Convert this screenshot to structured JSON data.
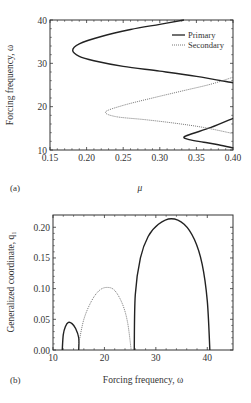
{
  "chart_data": [
    {
      "panel": "(a)",
      "type": "line",
      "xlabel": "μ",
      "ylabel": "Forcing frequency, ω",
      "xlim": [
        0.15,
        0.4
      ],
      "ylim": [
        10,
        40
      ],
      "xticks": [
        "0.15",
        "0.20",
        "0.25",
        "0.30",
        "0.35",
        "0.40"
      ],
      "yticks": [
        "10",
        "20",
        "30",
        "40"
      ],
      "legend": {
        "position": "upper right",
        "entries": [
          "Primary",
          "Secondary"
        ]
      },
      "series": [
        {
          "name": "Primary",
          "style": "solid",
          "points": [
            [
              0.333,
              40
            ],
            [
              0.3,
              39.0
            ],
            [
              0.26,
              37.8
            ],
            [
              0.22,
              36.2
            ],
            [
              0.19,
              34.5
            ],
            [
              0.181,
              33
            ],
            [
              0.19,
              31.6
            ],
            [
              0.21,
              30.6
            ],
            [
              0.25,
              29.3
            ],
            [
              0.3,
              28.2
            ],
            [
              0.35,
              27.0
            ],
            [
              0.4,
              25.5
            ]
          ]
        },
        {
          "name": "Primary (low)",
          "style": "solid",
          "points": [
            [
              0.4,
              17.3
            ],
            [
              0.37,
              15.2
            ],
            [
              0.345,
              13.8
            ],
            [
              0.333,
              13.0
            ],
            [
              0.34,
              12.4
            ],
            [
              0.36,
              11.8
            ],
            [
              0.38,
              11.2
            ],
            [
              0.4,
              10.5
            ]
          ]
        },
        {
          "name": "Secondary",
          "style": "dotted",
          "points": [
            [
              0.4,
              26.8
            ],
            [
              0.37,
              25.2
            ],
            [
              0.33,
              23.6
            ],
            [
              0.29,
              22.0
            ],
            [
              0.25,
              20.3
            ],
            [
              0.226,
              18.8
            ],
            [
              0.24,
              17.7
            ],
            [
              0.28,
              17.0
            ],
            [
              0.32,
              16.2
            ],
            [
              0.36,
              15.2
            ],
            [
              0.4,
              13.8
            ]
          ]
        }
      ]
    },
    {
      "panel": "(b)",
      "type": "line",
      "xlabel": "Forcing frequency, ω",
      "ylabel": "Generalized coordinate, q1",
      "xlim": [
        10,
        45
      ],
      "ylim": [
        0,
        0.22
      ],
      "xticks": [
        "10",
        "20",
        "30",
        "40"
      ],
      "yticks": [
        "0.00",
        "0.05",
        "0.10",
        "0.15",
        "0.20"
      ],
      "series": [
        {
          "name": "Primary lobe 1",
          "style": "solid",
          "points": [
            [
              11.8,
              0
            ],
            [
              12.0,
              0.025
            ],
            [
              12.4,
              0.038
            ],
            [
              13.0,
              0.045
            ],
            [
              13.7,
              0.043
            ],
            [
              14.4,
              0.035
            ],
            [
              15.0,
              0.02
            ],
            [
              15.0,
              0
            ]
          ]
        },
        {
          "name": "Secondary lobe",
          "style": "dotted",
          "points": [
            [
              15.0,
              0.01
            ],
            [
              16.0,
              0.05
            ],
            [
              17.5,
              0.08
            ],
            [
              19.0,
              0.097
            ],
            [
              20.5,
              0.102
            ],
            [
              22.0,
              0.097
            ],
            [
              23.5,
              0.075
            ],
            [
              24.5,
              0.045
            ],
            [
              25.2,
              0.0
            ]
          ]
        },
        {
          "name": "Primary lobe 2",
          "style": "solid",
          "points": [
            [
              25.8,
              0
            ],
            [
              26.0,
              0.09
            ],
            [
              27.0,
              0.15
            ],
            [
              28.5,
              0.185
            ],
            [
              30.5,
              0.205
            ],
            [
              33.0,
              0.214
            ],
            [
              35.5,
              0.205
            ],
            [
              37.5,
              0.18
            ],
            [
              39.0,
              0.14
            ],
            [
              40.0,
              0.08
            ],
            [
              40.5,
              0
            ]
          ]
        }
      ]
    }
  ],
  "panels": {
    "a": {
      "label": "(a)",
      "xlabel": "μ",
      "ylabel": "Forcing frequency,  ω",
      "legend_primary": "Primary",
      "legend_secondary": "Secondary",
      "xticks": [
        "0.15",
        "0.20",
        "0.25",
        "0.30",
        "0.35",
        "0.40"
      ],
      "yticks": [
        "10",
        "20",
        "30",
        "40"
      ]
    },
    "b": {
      "label": "(b)",
      "xlabel": "Forcing frequency,  ω",
      "ylabel": "Generalized coordinate,  q₁",
      "xticks": [
        "10",
        "20",
        "30",
        "40"
      ],
      "yticks": [
        "0.00",
        "0.05",
        "0.10",
        "0.15",
        "0.20"
      ]
    }
  },
  "colors": {
    "axis": "#333333",
    "primary": "#222222",
    "secondary": "#777777"
  }
}
